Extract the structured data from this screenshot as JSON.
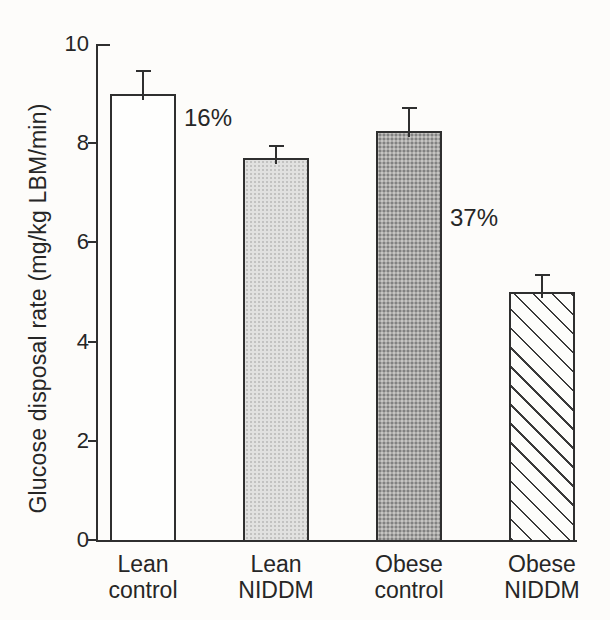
{
  "figure": {
    "background": "#fdfcfa",
    "ink_color": "#2f2f2f",
    "text_color": "#262626"
  },
  "chart_data": {
    "type": "bar",
    "title": "",
    "xlabel": "",
    "ylabel": "Glucose disposal rate (mg/kg LBM/min)",
    "ylim": [
      0,
      10
    ],
    "yticks": [
      0,
      2,
      4,
      6,
      8,
      10
    ],
    "grid": "off",
    "legend": "none",
    "categories": [
      "Lean control",
      "Lean NIDDM",
      "Obese control",
      "Obese NIDDM"
    ],
    "values": [
      9.0,
      7.7,
      8.25,
      5.0
    ],
    "errors": [
      0.45,
      0.25,
      0.45,
      0.35
    ],
    "error_bar_direction": "up",
    "bar_styles": [
      "white",
      "stipple-light",
      "stipple-dark",
      "hatch"
    ],
    "bar_fill_colors": [
      "#fefefd",
      "#e1e1e0",
      "#a9a8a6",
      "#fdfdfb"
    ],
    "annotations": [
      {
        "text": "16%",
        "bar_index": 0,
        "at_value": 8.5
      },
      {
        "text": "37%",
        "bar_index": 2,
        "at_value": 6.5
      }
    ]
  }
}
